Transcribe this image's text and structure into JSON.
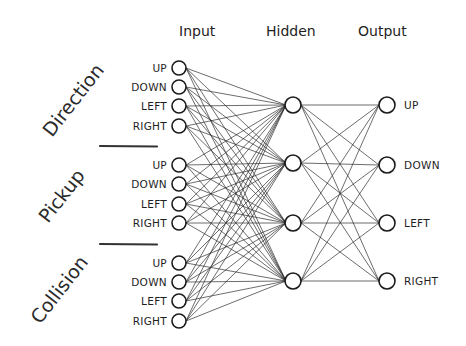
{
  "diagram": {
    "type": "neural-network",
    "layers": {
      "input": {
        "title": "Input",
        "x": 179,
        "groups": [
          {
            "label": "Direction",
            "nodes": [
              {
                "label": "UP",
                "y": 68
              },
              {
                "label": "DOWN",
                "y": 87
              },
              {
                "label": "LEFT",
                "y": 106
              },
              {
                "label": "RIGHT",
                "y": 126
              }
            ]
          },
          {
            "label": "Pickup",
            "nodes": [
              {
                "label": "UP",
                "y": 165
              },
              {
                "label": "DOWN",
                "y": 184
              },
              {
                "label": "LEFT",
                "y": 204
              },
              {
                "label": "RIGHT",
                "y": 223
              }
            ]
          },
          {
            "label": "Collision",
            "nodes": [
              {
                "label": "UP",
                "y": 263
              },
              {
                "label": "DOWN",
                "y": 282
              },
              {
                "label": "LEFT",
                "y": 301
              },
              {
                "label": "RIGHT",
                "y": 321
              }
            ]
          }
        ]
      },
      "hidden": {
        "title": "Hidden",
        "x": 293,
        "nodes": [
          {
            "y": 105
          },
          {
            "y": 163
          },
          {
            "y": 223
          },
          {
            "y": 281
          }
        ]
      },
      "output": {
        "title": "Output",
        "x": 387,
        "nodes": [
          {
            "label": "UP",
            "y": 105
          },
          {
            "label": "DOWN",
            "y": 165
          },
          {
            "label": "LEFT",
            "y": 223
          },
          {
            "label": "RIGHT",
            "y": 281
          }
        ]
      }
    },
    "dividers": [
      {
        "x1": 100,
        "x2": 157,
        "y": 146
      },
      {
        "x1": 100,
        "x2": 157,
        "y": 244
      }
    ],
    "colors": {
      "ink": "#1e1e1e",
      "background": "#ffffff"
    }
  }
}
